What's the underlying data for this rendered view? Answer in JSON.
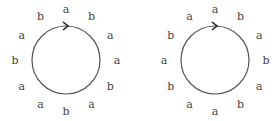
{
  "diagrams": [
    {
      "name": "left-circle",
      "center": [
        66,
        60
      ],
      "radius": 34,
      "stroke": "#555555",
      "arrow": "clockwise-at-top",
      "labels_clockwise_from_top": [
        "a",
        "b",
        "a",
        "a",
        "b",
        "a",
        "b",
        "a",
        "a",
        "b",
        "a",
        "b"
      ]
    },
    {
      "name": "right-circle",
      "center": [
        215,
        60
      ],
      "radius": 34,
      "stroke": "#555555",
      "arrow": "clockwise-at-top",
      "labels_clockwise_from_top": [
        "a",
        "b",
        "a",
        "b",
        "a",
        "b",
        "a",
        "a",
        "b",
        "a",
        "b",
        "a"
      ]
    }
  ]
}
